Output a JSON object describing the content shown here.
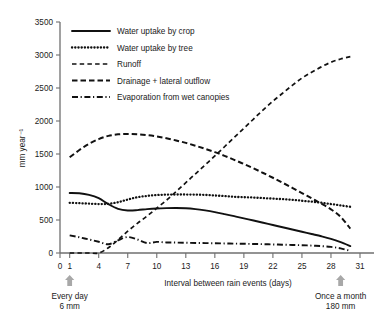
{
  "chart_data": {
    "type": "line",
    "title": "",
    "xlabel": "Interval between rain events (days)",
    "ylabel": "mm year⁻¹",
    "xlim": [
      0,
      31
    ],
    "ylim": [
      0,
      3500
    ],
    "grid": false,
    "legend_position": "top-left",
    "xticks": [
      0,
      1,
      4,
      7,
      10,
      13,
      16,
      19,
      22,
      25,
      28,
      31
    ],
    "xticklabels": [
      "0",
      "1",
      "4",
      "7",
      "10",
      "13",
      "16",
      "19",
      "22",
      "25",
      "28",
      "31"
    ],
    "yticks": [
      0,
      500,
      1000,
      1500,
      2000,
      2500,
      3000,
      3500
    ],
    "yticklabels": [
      "0",
      "500",
      "1000",
      "1500",
      "2000",
      "2500",
      "3000",
      "3500"
    ],
    "x": [
      1,
      2,
      3,
      4,
      5,
      6,
      7,
      8,
      9,
      10,
      11,
      12,
      13,
      14,
      15,
      16,
      17,
      18,
      19,
      20,
      21,
      22,
      23,
      24,
      25,
      26,
      27,
      28,
      29,
      30
    ],
    "series": [
      {
        "name": "Water uptake by crop",
        "style": "solid",
        "values": [
          910,
          905,
          880,
          830,
          740,
          670,
          645,
          650,
          665,
          675,
          680,
          682,
          678,
          665,
          645,
          620,
          590,
          558,
          525,
          492,
          458,
          424,
          390,
          356,
          322,
          288,
          254,
          215,
          165,
          105
        ]
      },
      {
        "name": "Water uptake by tree",
        "style": "dotted",
        "values": [
          760,
          755,
          748,
          742,
          745,
          770,
          810,
          845,
          865,
          878,
          884,
          886,
          886,
          884,
          880,
          872,
          862,
          852,
          845,
          840,
          832,
          824,
          816,
          806,
          792,
          778,
          762,
          742,
          722,
          700
        ]
      },
      {
        "name": "Runoff",
        "style": "dashed-short",
        "values": [
          0,
          0,
          0,
          0,
          80,
          200,
          330,
          450,
          560,
          680,
          800,
          930,
          1065,
          1200,
          1335,
          1470,
          1610,
          1750,
          1890,
          2030,
          2170,
          2300,
          2420,
          2540,
          2650,
          2740,
          2820,
          2890,
          2940,
          2975
        ]
      },
      {
        "name": "Drainage + lateral outflow",
        "style": "dashed-long",
        "values": [
          1450,
          1560,
          1655,
          1725,
          1775,
          1798,
          1803,
          1798,
          1785,
          1765,
          1738,
          1705,
          1668,
          1625,
          1578,
          1528,
          1472,
          1412,
          1348,
          1282,
          1212,
          1140,
          1065,
          988,
          908,
          828,
          748,
          662,
          548,
          370
        ]
      },
      {
        "name": "Evaporation from wet canopies",
        "style": "dashdot",
        "values": [
          268,
          238,
          205,
          170,
          132,
          192,
          242,
          205,
          150,
          168,
          160,
          158,
          155,
          152,
          150,
          148,
          145,
          142,
          140,
          137,
          134,
          130,
          126,
          122,
          118,
          112,
          104,
          92,
          70,
          32
        ]
      }
    ],
    "annotations": [
      {
        "name": "every-day",
        "x": 1,
        "marker": "up-arrow",
        "lines": [
          "Every day",
          "6 mm"
        ]
      },
      {
        "name": "once-a-month",
        "x": 29,
        "marker": "up-arrow",
        "lines": [
          "Once a month",
          "180 mm"
        ]
      }
    ],
    "colors": {
      "series_stroke": "#111111",
      "axis": "#6f6f6f",
      "text": "#1a1a1a",
      "arrow": "#a8a8a8",
      "background": "#ffffff"
    }
  }
}
